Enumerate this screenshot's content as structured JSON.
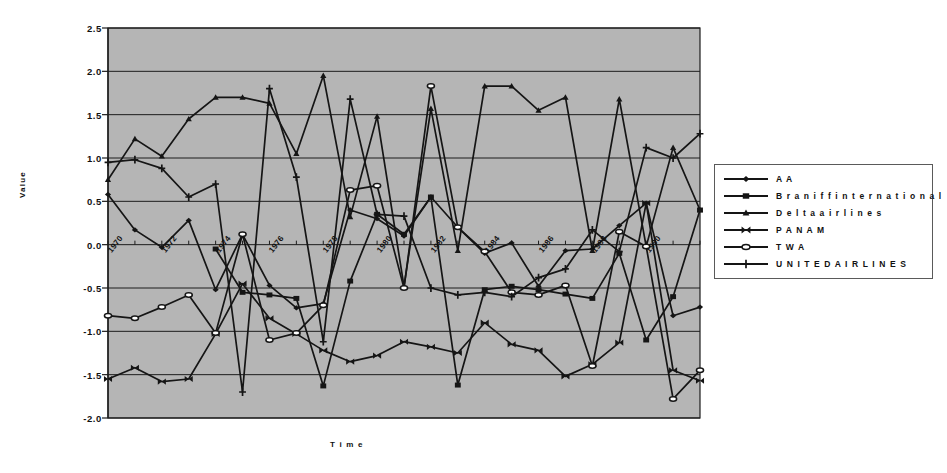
{
  "chart_data": {
    "type": "line",
    "title": "",
    "xlabel": "Time",
    "ylabel": "Value",
    "ylim": [
      -2.0,
      2.5
    ],
    "yticks": [
      "2.5",
      "2.0",
      "1.5",
      "1.0",
      "0.5",
      "0.0",
      "-0.5",
      "-1.0",
      "-1.5",
      "-2.0"
    ],
    "ytick_values": [
      2.5,
      2.0,
      1.5,
      1.0,
      0.5,
      0.0,
      -0.5,
      -1.0,
      -1.5,
      -2.0
    ],
    "grid": true,
    "plot_background": "#b5b5b5",
    "legend_position": "right-outside",
    "x": [
      1970,
      1971,
      1972,
      1973,
      1974,
      1975,
      1976,
      1977,
      1978,
      1979,
      1980,
      1981,
      1982,
      1983,
      1984,
      1985,
      1986,
      1987,
      1988,
      1989,
      1990,
      1991,
      1992
    ],
    "xticks": [
      "1970",
      "1972",
      "1974",
      "1976",
      "1978",
      "1980",
      "1982",
      "1984",
      "1986",
      "1988",
      "1990"
    ],
    "xtick_values": [
      1970,
      1972,
      1974,
      1976,
      1978,
      1980,
      1982,
      1984,
      1986,
      1988,
      1990
    ],
    "series": [
      {
        "name": "AA",
        "marker": "diamond",
        "color": "#151515",
        "values": [
          0.58,
          0.17,
          -0.03,
          0.28,
          -0.52,
          0.12,
          -0.47,
          -0.73,
          -0.68,
          0.4,
          0.3,
          0.1,
          0.55,
          0.2,
          -0.1,
          0.02,
          -0.48,
          -0.07,
          -0.05,
          0.22,
          0.48,
          -0.82,
          -0.72
        ]
      },
      {
        "name": "Braniff international",
        "marker": "square",
        "color": "#151515",
        "values": [
          null,
          null,
          null,
          null,
          -0.05,
          -0.55,
          -0.58,
          -0.62,
          -1.63,
          -0.42,
          0.35,
          0.12,
          0.55,
          -1.62,
          -0.52,
          -0.48,
          -0.52,
          -0.57,
          -0.62,
          -0.1,
          -1.1,
          -0.6,
          0.4
        ]
      },
      {
        "name": "Delta airlines",
        "marker": "triangle",
        "color": "#151515",
        "values": [
          0.75,
          1.22,
          1.02,
          1.45,
          1.7,
          1.7,
          1.63,
          1.05,
          1.95,
          0.32,
          1.48,
          -0.48,
          1.57,
          -0.07,
          1.83,
          1.83,
          1.55,
          1.7,
          -0.07,
          1.68,
          -0.02,
          1.12,
          0.4
        ]
      },
      {
        "name": "PAN AM",
        "marker": "bowtie",
        "color": "#151515",
        "values": [
          -1.55,
          -1.42,
          -1.58,
          -1.55,
          -1.03,
          -0.45,
          -0.85,
          -1.03,
          -1.22,
          -1.35,
          -1.28,
          -1.12,
          -1.18,
          -1.25,
          -0.9,
          -1.15,
          -1.22,
          -1.52,
          -1.38,
          -1.13,
          0.48,
          -1.45,
          -1.57
        ]
      },
      {
        "name": "TWA",
        "marker": "open-ellipse",
        "color": "#151515",
        "values": [
          -0.82,
          -0.85,
          -0.72,
          -0.58,
          -1.02,
          0.12,
          -1.1,
          -1.02,
          -0.7,
          0.63,
          0.68,
          -0.5,
          1.83,
          0.2,
          -0.08,
          -0.55,
          -0.58,
          -0.47,
          -1.4,
          0.15,
          -0.02,
          -1.78,
          -1.45
        ]
      },
      {
        "name": "UNITED AIRLINES",
        "marker": "plus",
        "color": "#151515",
        "values": [
          0.95,
          0.98,
          0.88,
          0.55,
          0.7,
          -1.7,
          1.8,
          0.78,
          -1.12,
          1.68,
          0.35,
          0.33,
          -0.5,
          -0.58,
          -0.55,
          -0.6,
          -0.38,
          -0.28,
          0.17,
          -0.08,
          1.12,
          1.0,
          1.28
        ]
      }
    ]
  },
  "legend": {
    "items": [
      {
        "label": "A A",
        "marker": "diamond"
      },
      {
        "label": "B r a n i f f  i n t e r n a t i o n a l",
        "marker": "square"
      },
      {
        "label": "D e l t a  a i r l i n e s",
        "marker": "triangle"
      },
      {
        "label": "P A N  A M",
        "marker": "bowtie"
      },
      {
        "label": "T W A",
        "marker": "open-ellipse"
      },
      {
        "label": "U N I T E D  A I R L I N E S",
        "marker": "plus"
      }
    ]
  },
  "labels": {
    "ylabel": "Value",
    "xlabel": "T i m e"
  }
}
